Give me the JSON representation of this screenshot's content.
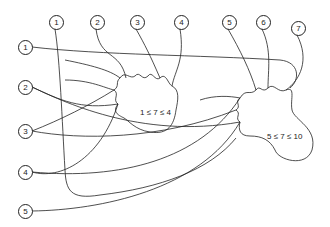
{
  "diagram": {
    "top_nodes": [
      {
        "label": "1",
        "x": 55,
        "y": 22
      },
      {
        "label": "2",
        "x": 96,
        "y": 22
      },
      {
        "label": "3",
        "x": 136,
        "y": 22
      },
      {
        "label": "4",
        "x": 180,
        "y": 22
      },
      {
        "label": "5",
        "x": 228,
        "y": 22
      },
      {
        "label": "6",
        "x": 262,
        "y": 22
      },
      {
        "label": "7",
        "x": 297,
        "y": 28
      }
    ],
    "left_nodes": [
      {
        "label": "1",
        "x": 25,
        "y": 47
      },
      {
        "label": "2",
        "x": 25,
        "y": 87
      },
      {
        "label": "3",
        "x": 25,
        "y": 131
      },
      {
        "label": "4",
        "x": 25,
        "y": 172
      },
      {
        "label": "5",
        "x": 25,
        "y": 211
      }
    ],
    "regions": [
      {
        "label": "1 ≤ 7 ≤ 4",
        "x": 140,
        "y": 113
      },
      {
        "label": "5 ≤ 7 ≤ 10",
        "x": 267,
        "y": 137
      }
    ]
  }
}
